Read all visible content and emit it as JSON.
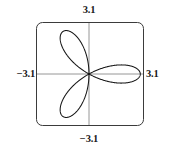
{
  "plot": {
    "labels": {
      "top": "3.1",
      "bottom": "−3.1",
      "left": "−3.1",
      "right": "3.1"
    },
    "colors": {
      "background": "#ffffff",
      "frame": "#3b3b3b",
      "axis": "#8a8a8a",
      "curve": "#171717",
      "text": "#1a1a1a"
    }
  },
  "chart_data": {
    "type": "line",
    "title": "",
    "subtitle": "",
    "xlabel": "",
    "ylabel": "",
    "xlim": [
      -3.1,
      3.1
    ],
    "ylim": [
      -3.1,
      3.1
    ],
    "grid": false,
    "legend": null,
    "axes_shown": true,
    "tick_labels": {
      "xmin": "−3.1",
      "xmax": "3.1",
      "ymin": "−3.1",
      "ymax": "3.1"
    },
    "annotations": [],
    "series": [
      {
        "name": "rose curve",
        "curve_family": "polar rose",
        "equation": "r = 3 cos(3θ)",
        "amplitude": 3,
        "petal_count": 6,
        "petal_angles_deg": [
          0,
          60,
          120,
          180,
          240,
          300
        ],
        "theta_range_deg": [
          0,
          360
        ],
        "closed": true,
        "note": "six-petal rose centered at origin; horizontal petals reach x = ±3"
      }
    ]
  }
}
